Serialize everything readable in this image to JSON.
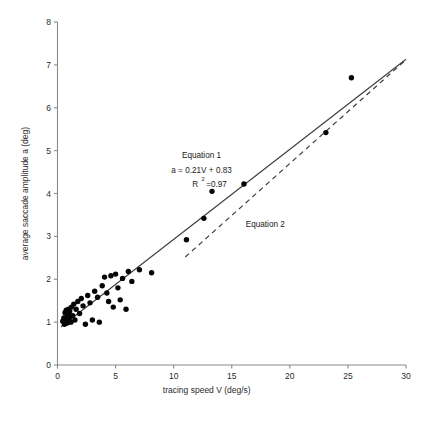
{
  "chart_data": {
    "type": "scatter",
    "title": "",
    "xlabel": "tracing speed V (deg/s)",
    "ylabel": "average saccade amplitude a (deg)",
    "xlim": [
      0,
      30
    ],
    "ylim": [
      0,
      8
    ],
    "xticks": [
      0,
      5,
      10,
      15,
      20,
      25,
      30
    ],
    "yticks": [
      0,
      1,
      2,
      3,
      4,
      5,
      6,
      7,
      8
    ],
    "xticklabels": [
      "0",
      "5",
      "10",
      "15",
      "20",
      "25",
      "30"
    ],
    "yticklabels": [
      "0",
      "1",
      "2",
      "3",
      "4",
      "5",
      "6",
      "7",
      "8"
    ],
    "grid": false,
    "legend": "none",
    "points": [
      [
        0.45,
        1.02
      ],
      [
        0.55,
        1.1
      ],
      [
        0.6,
        0.95
      ],
      [
        0.65,
        1.22
      ],
      [
        0.7,
        1.05
      ],
      [
        0.75,
        1.28
      ],
      [
        0.8,
        1.12
      ],
      [
        0.85,
        0.98
      ],
      [
        0.9,
        1.18
      ],
      [
        0.95,
        1.3
      ],
      [
        1.0,
        1.08
      ],
      [
        1.05,
        1.25
      ],
      [
        1.15,
        1.0
      ],
      [
        1.2,
        1.35
      ],
      [
        1.3,
        1.15
      ],
      [
        1.4,
        1.42
      ],
      [
        1.5,
        1.05
      ],
      [
        1.6,
        1.3
      ],
      [
        1.75,
        1.48
      ],
      [
        1.9,
        1.2
      ],
      [
        2.05,
        1.55
      ],
      [
        2.2,
        1.38
      ],
      [
        2.4,
        0.95
      ],
      [
        2.6,
        1.62
      ],
      [
        2.8,
        1.45
      ],
      [
        3.0,
        1.05
      ],
      [
        3.2,
        1.72
      ],
      [
        3.45,
        1.58
      ],
      [
        3.6,
        1.0
      ],
      [
        3.85,
        1.85
      ],
      [
        4.05,
        2.05
      ],
      [
        4.25,
        1.68
      ],
      [
        4.4,
        1.48
      ],
      [
        4.6,
        2.08
      ],
      [
        4.8,
        1.35
      ],
      [
        5.0,
        2.12
      ],
      [
        5.2,
        1.8
      ],
      [
        5.4,
        1.52
      ],
      [
        5.6,
        2.02
      ],
      [
        5.9,
        1.3
      ],
      [
        6.1,
        2.18
      ],
      [
        6.4,
        1.95
      ],
      [
        7.05,
        2.22
      ],
      [
        8.1,
        2.15
      ],
      [
        11.1,
        2.92
      ],
      [
        12.6,
        3.42
      ],
      [
        13.3,
        4.05
      ],
      [
        16.05,
        4.22
      ],
      [
        23.1,
        5.42
      ],
      [
        25.3,
        6.7
      ]
    ],
    "series": [
      {
        "name": "Equation 1",
        "type": "line",
        "style": "solid",
        "slope": 0.21,
        "intercept": 0.83,
        "r_squared": 0.97,
        "x_range": [
          0.3,
          30.0
        ]
      },
      {
        "name": "Equation 2",
        "type": "line",
        "style": "dashed",
        "x_range": [
          11.0,
          30.0
        ]
      }
    ],
    "annotations": [
      {
        "name": "equation-1-label",
        "text": "Equation 1",
        "x": 12.4,
        "y": 4.82
      },
      {
        "name": "equation-1-formula",
        "text": "a = 0.21V + 0.83",
        "x": 12.4,
        "y": 4.48
      },
      {
        "name": "equation-1-r2-base",
        "text": "R",
        "x": 11.6,
        "y": 4.14
      },
      {
        "name": "equation-1-r2-exp",
        "text": "2",
        "x": 12.4,
        "y": 4.28
      },
      {
        "name": "equation-1-r2-value",
        "text": "=0.97",
        "x": 12.8,
        "y": 4.14
      },
      {
        "name": "equation-2-label",
        "text": "Equation 2",
        "x": 16.2,
        "y": 3.22
      }
    ]
  }
}
